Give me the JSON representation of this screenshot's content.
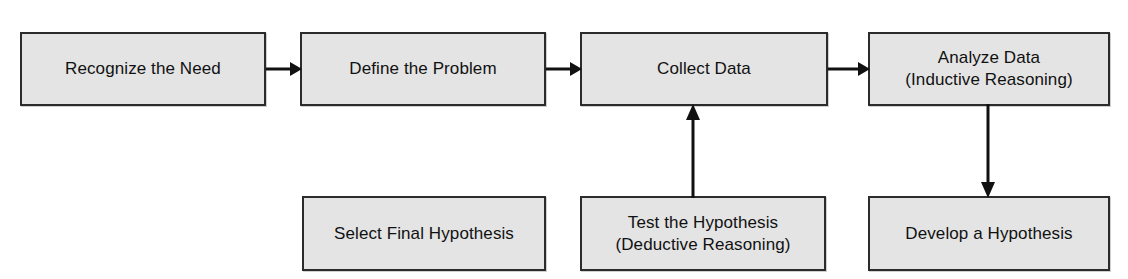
{
  "diagram": {
    "background_color": "#ffffff",
    "node_fill_color": "#e4e4e4",
    "node_border_color": "#2b2b2b",
    "edge_color": "#111111",
    "nodes": [
      {
        "id": "recognize-the-need",
        "label": "Recognize the Need",
        "row": "top",
        "x": 20,
        "y": 32,
        "w": 246,
        "h": 74
      },
      {
        "id": "define-the-problem",
        "label": "Define the Problem",
        "row": "top",
        "x": 300,
        "y": 32,
        "w": 246,
        "h": 74
      },
      {
        "id": "collect-data",
        "label": "Collect Data",
        "row": "top",
        "x": 580,
        "y": 32,
        "w": 248,
        "h": 74
      },
      {
        "id": "analyze-data",
        "label": "Analyze Data\n(Inductive Reasoning)",
        "row": "top",
        "x": 868,
        "y": 32,
        "w": 242,
        "h": 74
      },
      {
        "id": "select-final-hypothesis",
        "label": "Select Final Hypothesis",
        "row": "bottom",
        "x": 302,
        "y": 196,
        "w": 244,
        "h": 75
      },
      {
        "id": "test-the-hypothesis",
        "label": "Test the Hypothesis\n(Deductive Reasoning)",
        "row": "bottom",
        "x": 580,
        "y": 196,
        "w": 246,
        "h": 75
      },
      {
        "id": "develop-a-hypothesis",
        "label": "Develop a Hypothesis",
        "row": "bottom",
        "x": 868,
        "y": 196,
        "w": 242,
        "h": 75
      }
    ],
    "edges": [
      {
        "id": "recognize-to-define",
        "from": "recognize-the-need",
        "to": "define-the-problem",
        "direction": "right"
      },
      {
        "id": "define-to-collect",
        "from": "define-the-problem",
        "to": "collect-data",
        "direction": "right"
      },
      {
        "id": "collect-to-analyze",
        "from": "collect-data",
        "to": "analyze-data",
        "direction": "right"
      },
      {
        "id": "test-to-collect",
        "from": "test-the-hypothesis",
        "to": "collect-data",
        "direction": "up"
      },
      {
        "id": "analyze-to-develop",
        "from": "analyze-data",
        "to": "develop-a-hypothesis",
        "direction": "down"
      }
    ]
  }
}
